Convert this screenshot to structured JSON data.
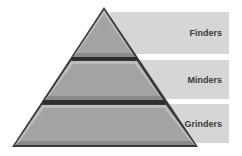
{
  "diagram": {
    "type": "pyramid",
    "levels": [
      {
        "label": "Finders",
        "color": "#a6a6a6"
      },
      {
        "label": "Minders",
        "color": "#a6a6a6"
      },
      {
        "label": "Grinders",
        "color": "#a6a6a6"
      }
    ],
    "panel_color": "#d6d6d6",
    "band_color": "#2e2e2e"
  }
}
